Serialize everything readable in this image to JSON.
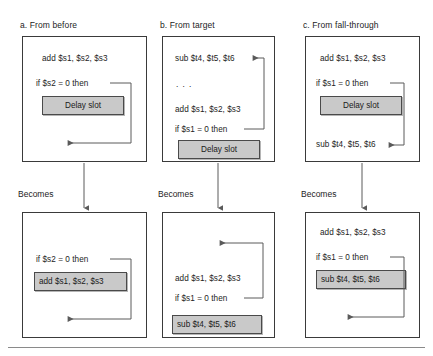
{
  "figure": {
    "title_hidden": "",
    "bottom_rule": true,
    "colors": {
      "shaded_fill": "#c9c9c9",
      "box_border": "#3a3a3a",
      "text": "#1d1d1d",
      "arrow": "#5a5a5a",
      "rule": "#8a8a8a"
    },
    "becomes_label": "Becomes"
  },
  "panels": [
    {
      "id": "a",
      "label": "a.  From before",
      "before": {
        "lines": [
          "add $s1, $s2, $s3",
          "if $s2 = 0 then"
        ],
        "highlighted": "Delay slot",
        "highlight_position": "below-branch",
        "branch_arrow": "down-to-bottom-left"
      },
      "after": {
        "lines": [
          "if $s2 = 0 then"
        ],
        "highlighted": "add $s1, $s2, $s3",
        "highlight_position": "below-branch",
        "branch_arrow": "down-to-bottom-left"
      }
    },
    {
      "id": "b",
      "label": "b.  From target",
      "before": {
        "lines": [
          "sub $t4, $t5, $t6",
          ". . .",
          "add $s1, $s2, $s3",
          "if $s1 = 0 then"
        ],
        "highlighted": "Delay slot",
        "highlight_position": "bottom",
        "branch_arrow": "up-to-first-line"
      },
      "after": {
        "lines": [
          "add $s1, $s2, $s3",
          "if $s1 = 0 then"
        ],
        "highlighted": "sub $t4, $t5, $t6",
        "highlight_position": "bottom",
        "branch_arrow": "up-to-top-left"
      }
    },
    {
      "id": "c",
      "label": "c.  From fall-through",
      "before": {
        "lines": [
          "add $s1, $s2, $s3",
          "if $s1 = 0 then",
          "sub $t4, $t5, $t6"
        ],
        "highlighted": "Delay slot",
        "highlight_position": "middle",
        "branch_arrow": "down-to-sub-line"
      },
      "after": {
        "lines": [
          "add $s1, $s2, $s3",
          "if $s1 = 0 then"
        ],
        "highlighted": "sub $t4, $t5, $t6",
        "highlight_position": "below-branch",
        "branch_arrow": "down-to-bottom-left"
      }
    }
  ],
  "text": {
    "a_label": "a.  From before",
    "b_label": "b.  From target",
    "c_label": "c.  From fall-through",
    "becomes_a": "Becomes",
    "becomes_b": "Becomes",
    "becomes_c": "Becomes",
    "a_top_line1": "add $s1, $s2, $s3",
    "a_top_line2": "if $s2 = 0 then",
    "a_top_slot": "Delay slot",
    "a_bot_line1": "if $s2 = 0 then",
    "a_bot_slot": "add $s1, $s2, $s3",
    "b_top_line1": "sub $t4, $t5, $t6",
    "b_top_line2": ". . .",
    "b_top_line3": "add $s1, $s2, $s3",
    "b_top_line4": "if $s1 = 0 then",
    "b_top_slot": "Delay slot",
    "b_bot_line1": "add $s1, $s2, $s3",
    "b_bot_line2": "if $s1 = 0 then",
    "b_bot_slot": "sub $t4, $t5, $t6",
    "c_top_line1": "add $s1, $s2, $s3",
    "c_top_line2": "if $s1 = 0 then",
    "c_top_slot": "Delay slot",
    "c_top_line3": "sub $t4, $t5, $t6",
    "c_bot_line1": "add $s1, $s2, $s3",
    "c_bot_line2": "if $s1 = 0 then",
    "c_bot_slot": "sub $t4, $t5, $t6"
  }
}
